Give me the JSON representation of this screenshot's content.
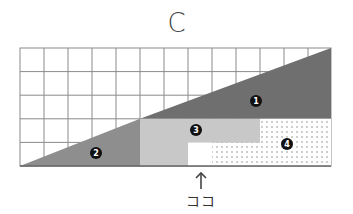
{
  "title": "C",
  "grid": {
    "columns": 13,
    "rows": 5,
    "line_color": "#888888"
  },
  "regions": [
    {
      "id": 1,
      "label": "1",
      "fill": "#6f6f6f",
      "pattern": "solid"
    },
    {
      "id": 2,
      "label": "2",
      "fill": "#8e8e8e",
      "pattern": "solid"
    },
    {
      "id": 3,
      "label": "3",
      "fill": "#c8c8c8",
      "pattern": "solid"
    },
    {
      "id": 4,
      "label": "4",
      "fill": "#ffffff",
      "pattern": "dots"
    }
  ],
  "pointer": {
    "arrow": "↑",
    "label": "ココ"
  }
}
